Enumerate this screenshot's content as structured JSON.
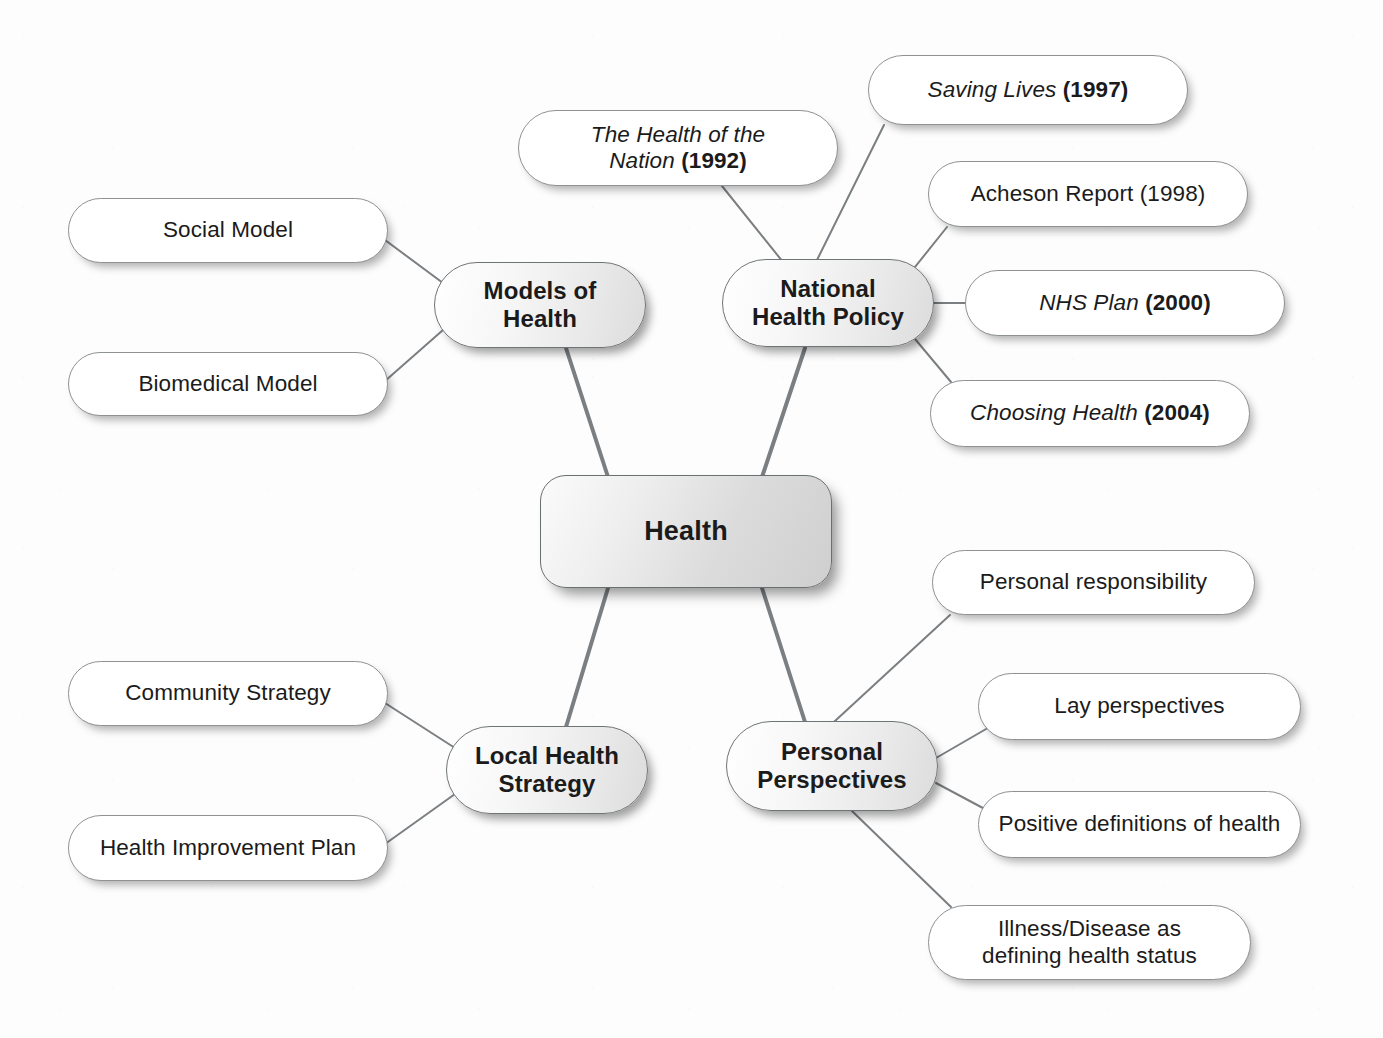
{
  "diagram": {
    "title": "Health",
    "type": "mind-map",
    "background_color": "#fdfdfd",
    "line_color": "#7b7f82"
  },
  "central": {
    "id": "health",
    "label": "Health",
    "x": 540,
    "y": 475,
    "w": 292,
    "h": 113,
    "fill": "#e2e2e2",
    "text_color": "#1b1b1b"
  },
  "branches": [
    {
      "id": "models-of-health",
      "label": "Models of\nHealth",
      "x": 434,
      "y": 262,
      "w": 212,
      "h": 86
    },
    {
      "id": "national-health-policy",
      "label": "National\nHealth Policy",
      "x": 722,
      "y": 259,
      "w": 212,
      "h": 88
    },
    {
      "id": "local-health-strategy",
      "label": "Local Health\nStrategy",
      "x": 446,
      "y": 726,
      "w": 202,
      "h": 88
    },
    {
      "id": "personal-perspectives",
      "label": "Personal\nPerspectives",
      "x": 726,
      "y": 721,
      "w": 212,
      "h": 90
    }
  ],
  "leaves": [
    {
      "id": "social-model",
      "parent": "models-of-health",
      "label": "Social Model",
      "italic_part": "",
      "roman_part": "",
      "x": 68,
      "y": 198,
      "w": 320,
      "h": 65
    },
    {
      "id": "biomedical-model",
      "parent": "models-of-health",
      "label": "Biomedical Model",
      "italic_part": "",
      "roman_part": "",
      "x": 68,
      "y": 352,
      "w": 320,
      "h": 64
    },
    {
      "id": "the-health-of-the-nation",
      "parent": "national-health-policy",
      "label": "The Health of the Nation (1992)",
      "italic_part": "The Health of the\nNation ",
      "roman_part": "(1992)",
      "x": 518,
      "y": 110,
      "w": 320,
      "h": 76
    },
    {
      "id": "saving-lives",
      "parent": "national-health-policy",
      "label": "Saving Lives (1997)",
      "italic_part": "Saving Lives ",
      "roman_part": "(1997)",
      "x": 868,
      "y": 55,
      "w": 320,
      "h": 70
    },
    {
      "id": "acheson-report",
      "parent": "national-health-policy",
      "label": "Acheson Report (1998)",
      "italic_part": "",
      "roman_part": "",
      "x": 928,
      "y": 161,
      "w": 320,
      "h": 66
    },
    {
      "id": "nhs-plan",
      "parent": "national-health-policy",
      "label": "NHS Plan (2000)",
      "italic_part": "NHS Plan ",
      "roman_part": "(2000)",
      "x": 965,
      "y": 270,
      "w": 320,
      "h": 66
    },
    {
      "id": "choosing-health",
      "parent": "national-health-policy",
      "label": "Choosing Health (2004)",
      "italic_part": "Choosing Health ",
      "roman_part": "(2004)",
      "x": 930,
      "y": 380,
      "w": 320,
      "h": 67
    },
    {
      "id": "community-strategy",
      "parent": "local-health-strategy",
      "label": "Community Strategy",
      "italic_part": "",
      "roman_part": "",
      "x": 68,
      "y": 661,
      "w": 320,
      "h": 65
    },
    {
      "id": "health-improvement-plan",
      "parent": "local-health-strategy",
      "label": "Health Improvement Plan",
      "italic_part": "",
      "roman_part": "",
      "x": 68,
      "y": 815,
      "w": 320,
      "h": 66
    },
    {
      "id": "personal-responsibility",
      "parent": "personal-perspectives",
      "label": "Personal responsibility",
      "italic_part": "",
      "roman_part": "",
      "x": 932,
      "y": 550,
      "w": 323,
      "h": 65
    },
    {
      "id": "lay-perspectives",
      "parent": "personal-perspectives",
      "label": "Lay perspectives",
      "italic_part": "",
      "roman_part": "",
      "x": 978,
      "y": 673,
      "w": 323,
      "h": 67
    },
    {
      "id": "positive-definitions-of-health",
      "parent": "personal-perspectives",
      "label": "Positive definitions of health",
      "italic_part": "",
      "roman_part": "",
      "x": 978,
      "y": 791,
      "w": 323,
      "h": 67
    },
    {
      "id": "illness-disease-defining-health-status",
      "parent": "personal-perspectives",
      "label": "Illness/Disease as\ndefining health status",
      "italic_part": "",
      "roman_part": "",
      "x": 928,
      "y": 905,
      "w": 323,
      "h": 75
    }
  ],
  "connectors": {
    "spoke_width": 4,
    "leaf_width": 2,
    "spokes": [
      {
        "from": "health",
        "to": "models-of-health",
        "x1": 608,
        "y1": 477,
        "x2": 566,
        "y2": 348
      },
      {
        "from": "health",
        "to": "national-health-policy",
        "x1": 762,
        "y1": 477,
        "x2": 805,
        "y2": 348
      },
      {
        "from": "health",
        "to": "local-health-strategy",
        "x1": 608,
        "y1": 588,
        "x2": 566,
        "y2": 727
      },
      {
        "from": "health",
        "to": "personal-perspectives",
        "x1": 762,
        "y1": 588,
        "x2": 805,
        "y2": 722
      }
    ],
    "leaf_links": [
      {
        "from": "models-of-health",
        "to": "social-model",
        "x1": 443,
        "y1": 283,
        "x2": 385,
        "y2": 240
      },
      {
        "from": "models-of-health",
        "to": "biomedical-model",
        "x1": 443,
        "y1": 330,
        "x2": 385,
        "y2": 381
      },
      {
        "from": "national-health-policy",
        "to": "the-health-of-the-nation",
        "x1": 783,
        "y1": 262,
        "x2": 722,
        "y2": 186
      },
      {
        "from": "national-health-policy",
        "to": "saving-lives",
        "x1": 816,
        "y1": 262,
        "x2": 884,
        "y2": 125
      },
      {
        "from": "national-health-policy",
        "to": "acheson-report",
        "x1": 903,
        "y1": 282,
        "x2": 947,
        "y2": 227
      },
      {
        "from": "national-health-policy",
        "to": "nhs-plan",
        "x1": 934,
        "y1": 303,
        "x2": 965,
        "y2": 303
      },
      {
        "from": "national-health-policy",
        "to": "choosing-health",
        "x1": 905,
        "y1": 327,
        "x2": 951,
        "y2": 382
      },
      {
        "from": "local-health-strategy",
        "to": "community-strategy",
        "x1": 455,
        "y1": 748,
        "x2": 385,
        "y2": 703
      },
      {
        "from": "local-health-strategy",
        "to": "health-improvement-plan",
        "x1": 455,
        "y1": 794,
        "x2": 385,
        "y2": 844
      },
      {
        "from": "personal-perspectives",
        "to": "personal-responsibility",
        "x1": 810,
        "y1": 744,
        "x2": 950,
        "y2": 615
      },
      {
        "from": "personal-perspectives",
        "to": "lay-perspectives",
        "x1": 936,
        "y1": 758,
        "x2": 993,
        "y2": 725
      },
      {
        "from": "personal-perspectives",
        "to": "positive-definitions-of-health",
        "x1": 936,
        "y1": 783,
        "x2": 996,
        "y2": 815
      },
      {
        "from": "personal-perspectives",
        "to": "illness-disease-defining-health-status",
        "x1": 852,
        "y1": 811,
        "x2": 951,
        "y2": 907
      }
    ]
  }
}
